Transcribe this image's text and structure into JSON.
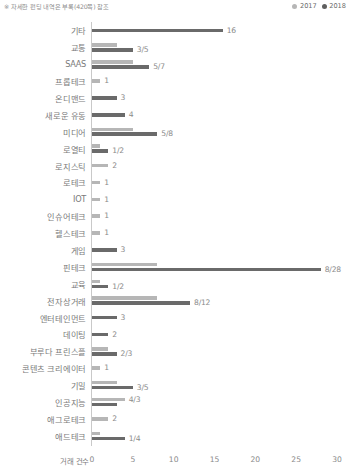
{
  "footnote": "※ 자세한 펀딩 내역은 부록(420쪽) 참조",
  "legend": {
    "items": [
      {
        "label": "2017",
        "color": "#b6b6b6"
      },
      {
        "label": "2018",
        "color": "#5f5f5f"
      }
    ]
  },
  "chart_data": {
    "type": "bar",
    "orientation": "horizontal",
    "title": "",
    "subtitle": "",
    "xlabel": "거래 건수",
    "ylabel": "",
    "xlim": [
      0,
      30
    ],
    "xticks": [
      0,
      5,
      10,
      15,
      20,
      25,
      30
    ],
    "grid": false,
    "legend_position": "top-right",
    "categories": [
      "기타",
      "교통",
      "SAAS",
      "프롭테크",
      "온디맨드",
      "새로운 유동",
      "미디어",
      "로열티",
      "로지스틱",
      "로테크",
      "IOT",
      "인슈어테크",
      "헬스테크",
      "게임",
      "핀테크",
      "교육",
      "전자상거래",
      "엔터테인먼트",
      "데이팅",
      "부루다 프린스플",
      "콘텐츠 크리에이터",
      "기밀",
      "인공지능",
      "애그로테크",
      "애드테크"
    ],
    "series": [
      {
        "name": "2017",
        "color": "#b6b6b6",
        "values": [
          null,
          3,
          5,
          1,
          null,
          null,
          5,
          1,
          2,
          1,
          1,
          1,
          1,
          null,
          8,
          1,
          8,
          null,
          null,
          2,
          1,
          3,
          4,
          2,
          1
        ]
      },
      {
        "name": "2018",
        "color": "#6a6a6a",
        "values": [
          16,
          5,
          7,
          null,
          3,
          4,
          8,
          2,
          null,
          null,
          null,
          null,
          null,
          3,
          28,
          2,
          12,
          3,
          2,
          3,
          null,
          5,
          3,
          null,
          4
        ]
      }
    ],
    "rows": [
      {
        "category": "기타",
        "v2017": null,
        "v2018": 16,
        "label": "16"
      },
      {
        "category": "교통",
        "v2017": 3,
        "v2018": 5,
        "label": "3/5"
      },
      {
        "category": "SAAS",
        "v2017": 5,
        "v2018": 7,
        "label": "5/7"
      },
      {
        "category": "프롭테크",
        "v2017": 1,
        "v2018": null,
        "label": "1"
      },
      {
        "category": "온디맨드",
        "v2017": null,
        "v2018": 3,
        "label": "3"
      },
      {
        "category": "새로운 유동",
        "v2017": null,
        "v2018": 4,
        "label": "4"
      },
      {
        "category": "미디어",
        "v2017": 5,
        "v2018": 8,
        "label": "5/8"
      },
      {
        "category": "로열티",
        "v2017": 1,
        "v2018": 2,
        "label": "1/2"
      },
      {
        "category": "로지스틱",
        "v2017": 2,
        "v2018": null,
        "label": "2"
      },
      {
        "category": "로테크",
        "v2017": 1,
        "v2018": null,
        "label": "1"
      },
      {
        "category": "IOT",
        "v2017": 1,
        "v2018": null,
        "label": "1"
      },
      {
        "category": "인슈어테크",
        "v2017": 1,
        "v2018": null,
        "label": "1"
      },
      {
        "category": "헬스테크",
        "v2017": 1,
        "v2018": null,
        "label": "1"
      },
      {
        "category": "게임",
        "v2017": null,
        "v2018": 3,
        "label": "3"
      },
      {
        "category": "핀테크",
        "v2017": 8,
        "v2018": 28,
        "label": "8/28"
      },
      {
        "category": "교육",
        "v2017": 1,
        "v2018": 2,
        "label": "1/2"
      },
      {
        "category": "전자상거래",
        "v2017": 8,
        "v2018": 12,
        "label": "8/12"
      },
      {
        "category": "엔터테인먼트",
        "v2017": null,
        "v2018": 3,
        "label": "3"
      },
      {
        "category": "데이팅",
        "v2017": null,
        "v2018": 2,
        "label": "2"
      },
      {
        "category": "부루다 프린스플",
        "v2017": 2,
        "v2018": 3,
        "label": "2/3"
      },
      {
        "category": "콘텐츠 크리에이터",
        "v2017": 1,
        "v2018": null,
        "label": "1"
      },
      {
        "category": "기밀",
        "v2017": 3,
        "v2018": 5,
        "label": "3/5"
      },
      {
        "category": "인공지능",
        "v2017": 4,
        "v2018": 3,
        "label": "4/3"
      },
      {
        "category": "애그로테크",
        "v2017": 2,
        "v2018": null,
        "label": "2"
      },
      {
        "category": "애드테크",
        "v2017": 1,
        "v2018": 4,
        "label": "1/4"
      }
    ]
  }
}
